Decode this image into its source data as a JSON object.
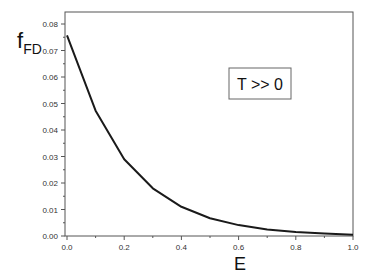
{
  "chart_data": {
    "type": "line",
    "title": "",
    "xlabel": "E",
    "ylabel": "f",
    "ylabel_subscript": "FD",
    "xlim": [
      0.0,
      1.0
    ],
    "ylim": [
      0.0,
      0.085
    ],
    "x_ticks": [
      "0.0",
      "0.2",
      "0.4",
      "0.6",
      "0.8",
      "1.0"
    ],
    "y_ticks": [
      "0.00",
      "0.01",
      "0.02",
      "0.03",
      "0.04",
      "0.05",
      "0.06",
      "0.07",
      "0.08"
    ],
    "grid": false,
    "legend": null,
    "annotation": "T >> 0",
    "series": [
      {
        "name": "f_FD",
        "color": "#1a1a1a",
        "x": [
          0.0,
          0.1,
          0.2,
          0.3,
          0.4,
          0.5,
          0.6,
          0.7,
          0.8,
          0.9,
          1.0
        ],
        "y": [
          0.0757,
          0.0473,
          0.029,
          0.018,
          0.011,
          0.0067,
          0.0041,
          0.0025,
          0.0015,
          0.0009,
          0.0005
        ]
      }
    ]
  }
}
